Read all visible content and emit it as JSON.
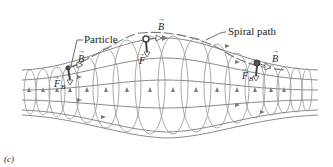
{
  "figure": {
    "panel_label": "(c)",
    "labels": {
      "particle": "Particle",
      "spiral_path": "Spiral path"
    },
    "vectors": {
      "left": {
        "field": "B",
        "force": "F",
        "force_sub": "B"
      },
      "middle": {
        "field": "B",
        "force": "F"
      },
      "right": {
        "field": "B",
        "force": "F",
        "force_sub": "B"
      }
    },
    "colors": {
      "field_line": "#8a8a8a",
      "loop": "#9a9a9a",
      "particle": "#555555",
      "text": "#222222"
    }
  }
}
